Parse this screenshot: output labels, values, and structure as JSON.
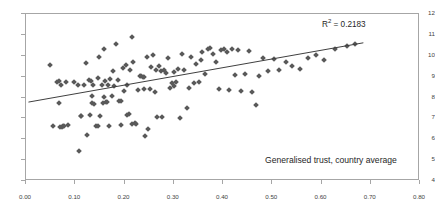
{
  "chart_data": {
    "type": "scatter",
    "title": "",
    "xlabel": "Generalised trust, country average",
    "ylabel": "Income per capita (ln)",
    "xlim": [
      0.0,
      0.8
    ],
    "ylim": [
      4,
      12
    ],
    "xticks": [
      "0.00",
      "0.10",
      "0.20",
      "0.30",
      "0.40",
      "0.50",
      "0.60",
      "0.70",
      "0.80"
    ],
    "xtick_values": [
      0.0,
      0.1,
      0.2,
      0.3,
      0.4,
      0.5,
      0.6,
      0.7,
      0.8
    ],
    "yticks": [
      "4",
      "5",
      "6",
      "7",
      "8",
      "9",
      "10",
      "11",
      "12"
    ],
    "ytick_values": [
      4,
      5,
      6,
      7,
      8,
      9,
      10,
      11,
      12
    ],
    "grid": false,
    "legend": false,
    "marker_shape": "diamond",
    "marker_color": "#595959",
    "annotations": [
      {
        "name": "r-squared",
        "text": "R² = 0.2183",
        "value": 0.2183,
        "x": 0.6,
        "y": 11.6
      }
    ],
    "trendline": {
      "type": "linear",
      "color": "#404040",
      "x_start": 0.005,
      "y_start": 7.78,
      "x_end": 0.685,
      "y_end": 10.62,
      "slope": 4.176,
      "intercept": 7.759,
      "r_squared": 0.2183
    },
    "points": [
      [
        0.048,
        9.55
      ],
      [
        0.054,
        6.63
      ],
      [
        0.063,
        8.72
      ],
      [
        0.066,
        8.8
      ],
      [
        0.068,
        7.72
      ],
      [
        0.069,
        6.6
      ],
      [
        0.071,
        8.58
      ],
      [
        0.073,
        6.58
      ],
      [
        0.076,
        6.62
      ],
      [
        0.078,
        6.64
      ],
      [
        0.082,
        8.74
      ],
      [
        0.085,
        6.7
      ],
      [
        0.097,
        8.73
      ],
      [
        0.105,
        8.62
      ],
      [
        0.108,
        5.42
      ],
      [
        0.112,
        7.12
      ],
      [
        0.118,
        8.62
      ],
      [
        0.121,
        9.63
      ],
      [
        0.124,
        6.18
      ],
      [
        0.127,
        8.85
      ],
      [
        0.129,
        7.15
      ],
      [
        0.131,
        8.78
      ],
      [
        0.133,
        7.72
      ],
      [
        0.136,
        8.6
      ],
      [
        0.139,
        7.7
      ],
      [
        0.142,
        6.65
      ],
      [
        0.146,
        8.95
      ],
      [
        0.148,
        9.92
      ],
      [
        0.151,
        7.12
      ],
      [
        0.154,
        8.58
      ],
      [
        0.157,
        7.74
      ],
      [
        0.159,
        10.3
      ],
      [
        0.161,
        8.8
      ],
      [
        0.163,
        7.78
      ],
      [
        0.164,
        7.8
      ],
      [
        0.166,
        8.62
      ],
      [
        0.168,
        6.65
      ],
      [
        0.171,
        8.9
      ],
      [
        0.176,
        9.25
      ],
      [
        0.179,
        8.56
      ],
      [
        0.183,
        10.55
      ],
      [
        0.186,
        8.86
      ],
      [
        0.189,
        7.82
      ],
      [
        0.192,
        7.84
      ],
      [
        0.196,
        9.4
      ],
      [
        0.199,
        8.32
      ],
      [
        0.203,
        9.58
      ],
      [
        0.206,
        8.62
      ],
      [
        0.209,
        7.22
      ],
      [
        0.212,
        9.3
      ],
      [
        0.215,
        10.92
      ],
      [
        0.218,
        9.72
      ],
      [
        0.221,
        6.78
      ],
      [
        0.224,
        6.75
      ],
      [
        0.227,
        8.36
      ],
      [
        0.231,
        9.02
      ],
      [
        0.234,
        9.05
      ],
      [
        0.237,
        9.0
      ],
      [
        0.239,
        8.4
      ],
      [
        0.242,
        6.15
      ],
      [
        0.245,
        9.95
      ],
      [
        0.248,
        6.48
      ],
      [
        0.251,
        8.42
      ],
      [
        0.254,
        9.46
      ],
      [
        0.257,
        10.02
      ],
      [
        0.261,
        8.28
      ],
      [
        0.264,
        9.3
      ],
      [
        0.267,
        7.08
      ],
      [
        0.271,
        9.52
      ],
      [
        0.274,
        9.28
      ],
      [
        0.276,
        7.06
      ],
      [
        0.281,
        9.34
      ],
      [
        0.284,
        9.16
      ],
      [
        0.288,
        9.9
      ],
      [
        0.292,
        8.46
      ],
      [
        0.296,
        8.68
      ],
      [
        0.301,
        9.24
      ],
      [
        0.304,
        8.72
      ],
      [
        0.308,
        9.38
      ],
      [
        0.312,
        7.0
      ],
      [
        0.316,
        10.08
      ],
      [
        0.321,
        9.34
      ],
      [
        0.326,
        7.52
      ],
      [
        0.331,
        8.44
      ],
      [
        0.336,
        9.96
      ],
      [
        0.341,
        8.68
      ],
      [
        0.346,
        9.6
      ],
      [
        0.352,
        8.74
      ],
      [
        0.358,
        10.2
      ],
      [
        0.364,
        9.12
      ],
      [
        0.369,
        10.32
      ],
      [
        0.374,
        10.38
      ],
      [
        0.379,
        10.1
      ],
      [
        0.385,
        9.68
      ],
      [
        0.391,
        8.4
      ],
      [
        0.396,
        10.28
      ],
      [
        0.402,
        10.34
      ],
      [
        0.408,
        10.18
      ],
      [
        0.413,
        8.36
      ],
      [
        0.419,
        10.3
      ],
      [
        0.424,
        9.08
      ],
      [
        0.431,
        10.28
      ],
      [
        0.437,
        8.3
      ],
      [
        0.444,
        9.12
      ],
      [
        0.452,
        10.22
      ],
      [
        0.459,
        8.28
      ],
      [
        0.466,
        7.62
      ],
      [
        0.473,
        9.02
      ],
      [
        0.481,
        9.9
      ],
      [
        0.492,
        9.28
      ],
      [
        0.503,
        9.86
      ],
      [
        0.514,
        9.3
      ],
      [
        0.527,
        9.72
      ],
      [
        0.541,
        9.52
      ],
      [
        0.556,
        9.36
      ],
      [
        0.573,
        9.88
      ],
      [
        0.589,
        10.04
      ],
      [
        0.606,
        9.78
      ],
      [
        0.628,
        10.3
      ],
      [
        0.651,
        10.48
      ],
      [
        0.668,
        10.58
      ],
      [
        0.216,
        6.72
      ],
      [
        0.193,
        6.7
      ],
      [
        0.147,
        6.62
      ],
      [
        0.111,
        7.1
      ],
      [
        0.24,
        8.98
      ],
      [
        0.3,
        8.56
      ],
      [
        0.356,
        9.8
      ],
      [
        0.205,
        7.18
      ],
      [
        0.175,
        8.08
      ],
      [
        0.158,
        8.04
      ],
      [
        0.135,
        8.06
      ]
    ]
  }
}
